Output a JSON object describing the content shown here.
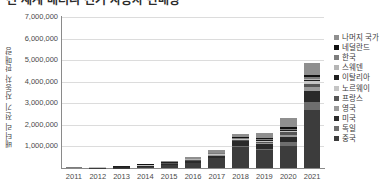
{
  "title": "전 세계 배터리 전기 자동차 판매량",
  "chart_data": {
    "type": "bar",
    "stacked": true,
    "title": "전 세계 배터리 전기 자동차 판매량",
    "xlabel": "",
    "ylabel": "배터리 전기 자동차 판매량",
    "ylim": [
      0,
      7000000
    ],
    "grid": true,
    "legend_position": "right",
    "categories": [
      "2011",
      "2012",
      "2013",
      "2014",
      "2015",
      "2016",
      "2017",
      "2018",
      "2019",
      "2020",
      "2021"
    ],
    "ytick_labels": [
      "7,000,000",
      "6,000,000",
      "5,000,000",
      "4,000,000",
      "3,000,000",
      "2,000,000",
      "1,000,000"
    ],
    "ytick_values": [
      7000000,
      6000000,
      5000000,
      4000000,
      3000000,
      2000000,
      1000000
    ],
    "series": [
      {
        "name": "중국",
        "color": "#3c3c3c",
        "values": [
          6000,
          11000,
          15000,
          45000,
          146000,
          257000,
          468000,
          984000,
          834000,
          1005000,
          2700000
        ]
      },
      {
        "name": "독일",
        "color": "#6e6e6e",
        "values": [
          2000,
          3000,
          5000,
          8000,
          12000,
          11000,
          25000,
          36000,
          63000,
          194000,
          356000
        ]
      },
      {
        "name": "미국",
        "color": "#2a2a2a",
        "values": [
          10000,
          14000,
          47000,
          63000,
          71000,
          86000,
          104000,
          237000,
          242000,
          231000,
          505000
        ]
      },
      {
        "name": "영국",
        "color": "#9a9a9a",
        "values": [
          1000,
          1400,
          2500,
          6700,
          9900,
          10500,
          13600,
          15500,
          37900,
          108000,
          190000
        ]
      },
      {
        "name": "프랑스",
        "color": "#555555",
        "values": [
          2600,
          5700,
          8800,
          10600,
          17300,
          21800,
          26000,
          31100,
          42800,
          111000,
          162000
        ]
      },
      {
        "name": "노르웨이",
        "color": "#c4c4c4",
        "values": [
          2000,
          3900,
          7900,
          18000,
          25700,
          24200,
          33000,
          46100,
          60300,
          76800,
          113000
        ]
      },
      {
        "name": "이탈리아",
        "color": "#1e1e1e",
        "values": [
          300,
          500,
          900,
          1100,
          1500,
          1400,
          1900,
          5000,
          10600,
          32500,
          67000
        ]
      },
      {
        "name": "스웨덴",
        "color": "#b5b5b5",
        "values": [
          200,
          300,
          500,
          1200,
          2900,
          2900,
          4200,
          7100,
          15800,
          28000,
          57000
        ]
      },
      {
        "name": "한국",
        "color": "#7d7d7d",
        "values": [
          300,
          600,
          800,
          1200,
          2900,
          5100,
          13800,
          29500,
          34900,
          31200,
          71000
        ]
      },
      {
        "name": "네덜란드",
        "color": "#101010",
        "values": [
          300,
          800,
          2300,
          3000,
          2700,
          4000,
          8000,
          24000,
          41000,
          73000,
          72000
        ]
      },
      {
        "name": "나머지 국가",
        "color": "#8f8f8f",
        "values": [
          5300,
          9800,
          19300,
          32200,
          57100,
          86100,
          122500,
          184700,
          237700,
          409500,
          557000
        ]
      }
    ]
  },
  "legend": {
    "items": [
      {
        "label": "나머지 국가",
        "color": "#8f8f8f"
      },
      {
        "label": "네덜란드",
        "color": "#101010"
      },
      {
        "label": "한국",
        "color": "#7d7d7d"
      },
      {
        "label": "스웨덴",
        "color": "#b5b5b5"
      },
      {
        "label": "이탈리아",
        "color": "#1e1e1e"
      },
      {
        "label": "노르웨이",
        "color": "#c4c4c4"
      },
      {
        "label": "프랑스",
        "color": "#555555"
      },
      {
        "label": "영국",
        "color": "#9a9a9a"
      },
      {
        "label": "미국",
        "color": "#2a2a2a"
      },
      {
        "label": "독일",
        "color": "#6e6e6e"
      },
      {
        "label": "중국",
        "color": "#3c3c3c"
      }
    ]
  },
  "colors": {
    "grid": "#dcdcdc",
    "axis": "#8a8a8a",
    "text": "#4a4a4a",
    "background": "#ffffff"
  }
}
